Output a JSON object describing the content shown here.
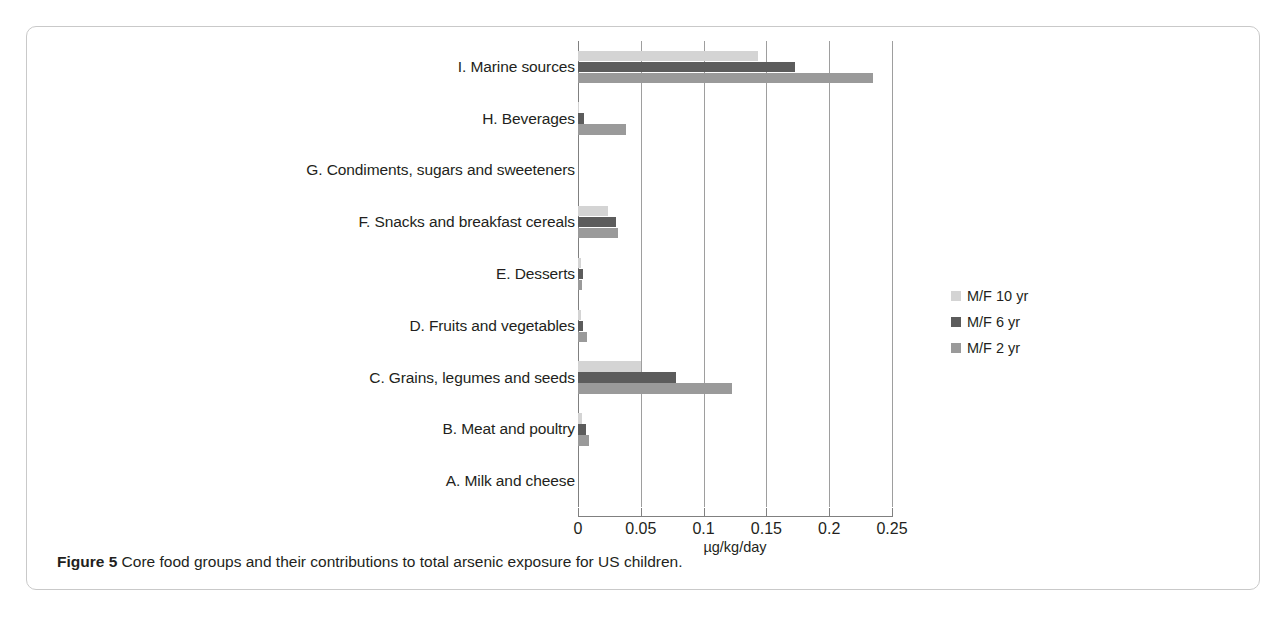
{
  "figure": {
    "caption_bold": "Figure 5",
    "caption_text": "Core food groups and their contributions to total arsenic exposure for US children."
  },
  "colors": {
    "series_10yr": "#d4d4d4",
    "series_6yr": "#5c5c5c",
    "series_2yr": "#9a9a9a",
    "gridline": "#9e9e9e",
    "axis": "#808080",
    "text": "#231f20",
    "card_border": "#c9c9c9"
  },
  "legend": {
    "position": "right",
    "entries": [
      {
        "label": "M/F 10 yr",
        "color": "#d4d4d4"
      },
      {
        "label": "M/F 6 yr",
        "color": "#5c5c5c"
      },
      {
        "label": "M/F 2 yr",
        "color": "#9a9a9a"
      }
    ]
  },
  "chart_data": {
    "type": "bar",
    "orientation": "horizontal",
    "title": "",
    "xlabel": "µg/kg/day",
    "ylabel": "",
    "xlim": [
      0,
      0.25
    ],
    "xticks": [
      0,
      0.05,
      0.1,
      0.15,
      0.2,
      0.25
    ],
    "xticklabels": [
      "0",
      "0.05",
      "0.1",
      "0.15",
      "0.2",
      "0.25"
    ],
    "grid": true,
    "grid_axis": "x",
    "legend_position": "right",
    "categories": [
      "I. Marine sources",
      "H. Beverages",
      "G. Condiments, sugars and sweeteners",
      "F. Snacks and breakfast cereals",
      "E. Desserts",
      "D. Fruits and vegetables",
      "C. Grains, legumes and seeds",
      "B. Meat and poultry",
      "A. Milk and cheese"
    ],
    "series": [
      {
        "name": "M/F 10 yr",
        "color": "#d4d4d4",
        "values": [
          0.143,
          0.001,
          0.0,
          0.024,
          0.002,
          0.002,
          0.05,
          0.003,
          0.0
        ]
      },
      {
        "name": "M/F 6 yr",
        "color": "#5c5c5c",
        "values": [
          0.173,
          0.005,
          0.0,
          0.03,
          0.004,
          0.004,
          0.078,
          0.006,
          0.0
        ]
      },
      {
        "name": "M/F 2 yr",
        "color": "#9a9a9a",
        "values": [
          0.235,
          0.038,
          0.0,
          0.032,
          0.003,
          0.007,
          0.123,
          0.009,
          0.0
        ]
      }
    ]
  }
}
